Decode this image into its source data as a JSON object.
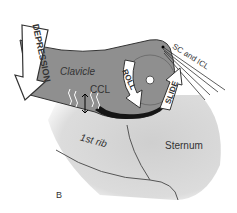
{
  "figure": {
    "panel_label": "B",
    "labels": {
      "depression": "DEPRESSION",
      "clavicle": "Clavicle",
      "ccl": "CCL",
      "roll": "ROLL",
      "slide": "SLIDE",
      "sc_icl": "SC and ICL",
      "first_rib": "1st rib",
      "sternum": "Sternum"
    },
    "colors": {
      "clavicle": "#8c8c8c",
      "clavicle_dark": "#1a1a1a",
      "background_tissue": "#d6d6d6",
      "arrow_fill": "#ffffff",
      "outline": "#222222"
    }
  }
}
